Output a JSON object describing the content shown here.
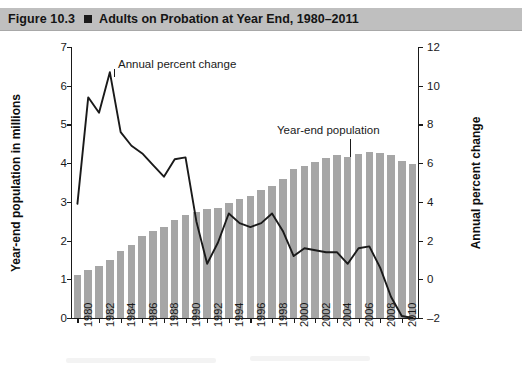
{
  "figure": {
    "label": "Figure 10.3",
    "marker_icon": "square-bullet-icon",
    "title": "Adults on Probation at Year End, 1980–2011"
  },
  "axes": {
    "left_title": "Year-end population in millions",
    "right_title": "Annual percent change",
    "left_ticks": [
      "0",
      "1",
      "2",
      "3",
      "4",
      "5",
      "6",
      "7"
    ],
    "right_ticks": [
      "–2",
      "0",
      "2",
      "4",
      "6",
      "8",
      "10",
      "12"
    ],
    "x_ticks": [
      "1980",
      "1982",
      "1984",
      "1986",
      "1988",
      "1990",
      "1992",
      "1994",
      "1996",
      "1998",
      "2000",
      "2002",
      "2004",
      "2006",
      "2008",
      "2010"
    ]
  },
  "annotations": {
    "line_label": "Annual percent change",
    "bar_label": "Year-end population"
  },
  "colors": {
    "bar_fill": "#a6a6a6",
    "line_stroke": "#1a1a1a",
    "banner": "#bfbfbf",
    "axis": "#1a1a1a",
    "background": "#ffffff"
  },
  "chart_data": {
    "type": "bar",
    "title": "Adults on Probation at Year End, 1980–2011",
    "subtitle": "Figure 10.3",
    "xlabel": "",
    "ylabel": "Year-end population in millions",
    "y2label": "Annual percent change",
    "ylim": [
      0,
      7
    ],
    "y2lim": [
      -2,
      12
    ],
    "grid": false,
    "legend": "annotations-inline",
    "categories": [
      1980,
      1981,
      1982,
      1983,
      1984,
      1985,
      1986,
      1987,
      1988,
      1989,
      1990,
      1991,
      1992,
      1993,
      1994,
      1995,
      1996,
      1997,
      1998,
      1999,
      2000,
      2001,
      2002,
      2003,
      2004,
      2005,
      2006,
      2007,
      2008,
      2009,
      2010,
      2011
    ],
    "series": [
      {
        "name": "Year-end population",
        "type": "bar",
        "axis": "left",
        "unit": "millions",
        "values": [
          1.12,
          1.23,
          1.34,
          1.51,
          1.74,
          1.89,
          2.11,
          2.24,
          2.36,
          2.52,
          2.67,
          2.73,
          2.81,
          2.84,
          2.96,
          3.08,
          3.16,
          3.3,
          3.42,
          3.59,
          3.84,
          3.93,
          4.02,
          4.14,
          4.22,
          4.16,
          4.24,
          4.29,
          4.27,
          4.2,
          4.06,
          3.97
        ]
      },
      {
        "name": "Annual percent change",
        "type": "line",
        "axis": "right",
        "unit": "percent",
        "values": [
          3.9,
          9.4,
          8.6,
          10.7,
          7.6,
          6.9,
          6.5,
          5.9,
          5.3,
          6.2,
          6.3,
          3.0,
          0.8,
          1.9,
          3.4,
          2.9,
          2.7,
          2.9,
          3.4,
          2.5,
          1.2,
          1.6,
          1.5,
          1.4,
          1.4,
          0.8,
          1.6,
          1.7,
          0.6,
          -0.9,
          -1.9,
          -2.0
        ]
      }
    ]
  }
}
